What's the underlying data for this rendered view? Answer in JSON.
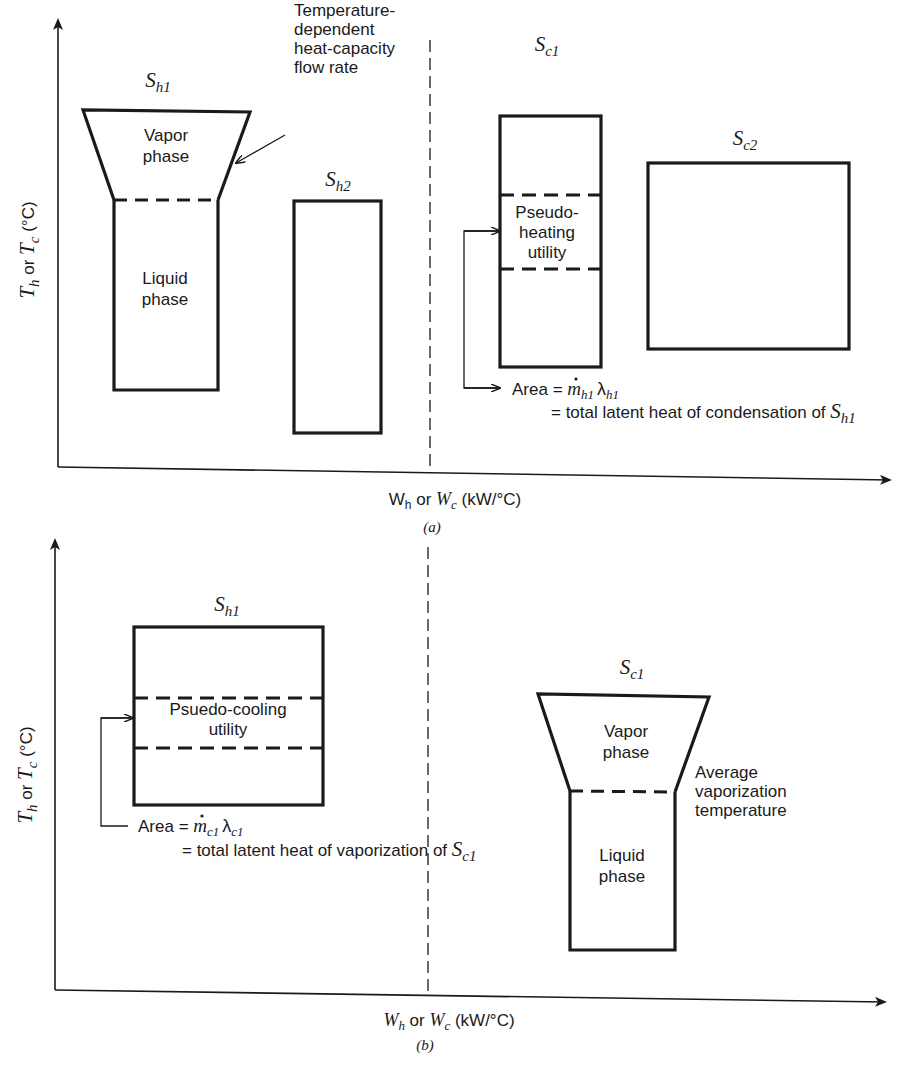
{
  "colors": {
    "ink": "#1a1a1a",
    "background": "#ffffff"
  },
  "panels": [
    {
      "id": "a",
      "caption": "(a)",
      "caption_pos": [
        432,
        532
      ],
      "y_axis": {
        "x": 58,
        "top": 20,
        "bottom": 467,
        "label_main": "T",
        "label_sub_h": "h",
        "label_or": " or ",
        "label_sub_c": "c",
        "label_unit": " (°C)",
        "label_pos": [
          34,
          250
        ]
      },
      "x_axis": {
        "y_left": 467,
        "y_right": 480,
        "left": 58,
        "right": 890,
        "label_W1": "W",
        "label_sub_h": "h",
        "label_or": " or ",
        "label_W2": "W",
        "label_sub_c": "c",
        "label_unit": " (kW/°C)",
        "label_pos": [
          455,
          505
        ]
      },
      "pinch_line": {
        "x": 430,
        "top": 40,
        "bottom": 472
      },
      "streams": [
        {
          "name": "S",
          "sub": "h1",
          "label_pos": [
            158,
            87
          ],
          "shape": "funnel",
          "top": [
            83,
            110,
            250,
            112
          ],
          "neck": [
            114,
            200,
            218,
            200
          ],
          "bottom": 390,
          "phase_labels": [
            {
              "lines": [
                "Vapor",
                "phase"
              ],
              "pos": [
                166,
                141
              ]
            },
            {
              "lines": [
                "Liquid",
                "phase"
              ],
              "pos": [
                165,
                284
              ]
            }
          ]
        },
        {
          "name": "S",
          "sub": "h2",
          "label_pos": [
            338,
            186
          ],
          "shape": "rect",
          "box": [
            294,
            201,
            381,
            433
          ]
        },
        {
          "name": "S",
          "sub": "c1",
          "label_pos": [
            547,
            51
          ],
          "shape": "rect",
          "box": [
            500,
            116,
            601,
            367
          ],
          "dashes": [
            195,
            269
          ],
          "band_label": {
            "lines": [
              "Pseudo-",
              "heating",
              "utility"
            ],
            "pos": [
              547,
              218
            ]
          }
        },
        {
          "name": "S",
          "sub": "c2",
          "label_pos": [
            745,
            145
          ],
          "shape": "rect",
          "box": [
            648,
            163,
            849,
            349
          ]
        }
      ],
      "annotations": [
        {
          "lines": [
            "Temperature-",
            "dependent",
            "heat-capacity",
            "flow rate"
          ],
          "pos": [
            294,
            76
          ],
          "arrow": {
            "from": [
              285,
              135
            ],
            "to": [
              236,
              163
            ]
          }
        },
        {
          "bracket": {
            "x": 464,
            "top": 231,
            "bottom": 388,
            "target_top": 500,
            "target_bottom": 500
          },
          "line1_prefix": "Area = ",
          "line1_m": "m",
          "line1_m_sub": "h1",
          "line1_lambda": "λ",
          "line1_lambda_sub": "h1",
          "line1_pos": [
            512,
            395
          ],
          "line2": "= total latent heat of condensation of ",
          "line2_S": "S",
          "line2_S_sub": "h1",
          "line2_pos": [
            551,
            418
          ]
        }
      ]
    },
    {
      "id": "b",
      "caption": "(b)",
      "caption_pos": [
        425,
        1050
      ],
      "y_axis": {
        "x": 55,
        "top": 540,
        "bottom": 990,
        "label_main": "T",
        "label_sub_h": "h",
        "label_or": " or ",
        "label_sub_c": "c",
        "label_unit": " (°C)",
        "label_pos": [
          32,
          775
        ]
      },
      "x_axis": {
        "y_left": 990,
        "y_right": 1002,
        "left": 55,
        "right": 885,
        "label_W1": "W",
        "label_sub_h": "h",
        "label_or": " or ",
        "label_W2": "W",
        "label_sub_c": "c",
        "label_unit": " (kW/°C)",
        "label_pos": [
          449,
          1026
        ]
      },
      "pinch_line": {
        "x": 428,
        "top": 547,
        "bottom": 996
      },
      "streams": [
        {
          "name": "S",
          "sub": "h1",
          "label_pos": [
            227,
            611
          ],
          "shape": "rect",
          "box": [
            134,
            627,
            323,
            805
          ],
          "dashes": [
            698,
            748
          ],
          "band_label": {
            "lines": [
              "Psuedo-cooling",
              "utility"
            ],
            "pos": [
              228,
              715
            ]
          }
        },
        {
          "name": "S",
          "sub": "c1",
          "label_pos": [
            632,
            674
          ],
          "shape": "funnel",
          "top": [
            538,
            694,
            709,
            697
          ],
          "neck": [
            570,
            791,
            675,
            792
          ],
          "bottom": 950,
          "phase_labels": [
            {
              "lines": [
                "Vapor",
                "phase"
              ],
              "pos": [
                626,
                737
              ]
            },
            {
              "lines": [
                "Liquid",
                "phase"
              ],
              "pos": [
                622,
                861
              ]
            }
          ]
        }
      ],
      "annotations": [
        {
          "lines": [
            "Average",
            "vaporization",
            "temperature"
          ],
          "pos": [
            695,
            778
          ]
        },
        {
          "bracket": {
            "x": 101,
            "top": 718,
            "bottom": 826,
            "target_top": 133,
            "target_bottom": 128
          },
          "line1_prefix": "Area = ",
          "line1_m": "m",
          "line1_m_sub": "c1",
          "line1_lambda": "λ",
          "line1_lambda_sub": "c1",
          "line1_pos": [
            138,
            832
          ],
          "line2": "= total latent heat of vaporization of ",
          "line2_S": "S",
          "line2_S_sub": "c1",
          "line2_pos": [
            182,
            856
          ]
        }
      ]
    }
  ]
}
